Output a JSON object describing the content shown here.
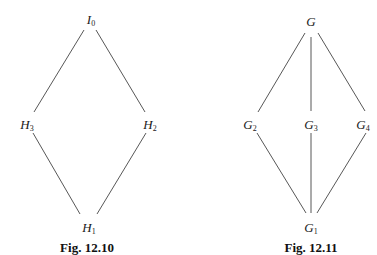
{
  "figures": [
    {
      "caption": "Fig. 12.10",
      "caption_pos": [
        87,
        247
      ],
      "nodes": [
        {
          "id": "I0",
          "base": "I",
          "sub": "0",
          "pos": [
            91,
            20
          ]
        },
        {
          "id": "H3",
          "base": "H",
          "sub": "3",
          "pos": [
            27,
            125
          ]
        },
        {
          "id": "H2",
          "base": "H",
          "sub": "2",
          "pos": [
            150,
            125
          ]
        },
        {
          "id": "H1",
          "base": "H",
          "sub": "1",
          "pos": [
            89,
            228
          ]
        }
      ],
      "edges": [
        {
          "from": "I0",
          "to": "H3",
          "line": [
            84,
            30,
            34,
            112
          ]
        },
        {
          "from": "I0",
          "to": "H2",
          "line": [
            96,
            30,
            145,
            112
          ]
        },
        {
          "from": "H3",
          "to": "H1",
          "line": [
            33,
            133,
            80,
            214
          ]
        },
        {
          "from": "H2",
          "to": "H1",
          "line": [
            146,
            133,
            97,
            214
          ]
        }
      ]
    },
    {
      "caption": "Fig. 12.11",
      "caption_pos": [
        311,
        247
      ],
      "nodes": [
        {
          "id": "G",
          "base": "G",
          "sub": "",
          "pos": [
            311,
            22
          ]
        },
        {
          "id": "G2",
          "base": "G",
          "sub": "2",
          "pos": [
            250,
            125
          ]
        },
        {
          "id": "G3",
          "base": "G",
          "sub": "3",
          "pos": [
            311,
            125
          ]
        },
        {
          "id": "G4",
          "base": "G",
          "sub": "4",
          "pos": [
            363,
            125
          ]
        },
        {
          "id": "G1",
          "base": "G",
          "sub": "1",
          "pos": [
            311,
            228
          ]
        }
      ],
      "edges": [
        {
          "from": "G",
          "to": "G2",
          "line": [
            305,
            33,
            258,
            112
          ]
        },
        {
          "from": "G",
          "to": "G3",
          "line": [
            311,
            37,
            311,
            111
          ]
        },
        {
          "from": "G",
          "to": "G4",
          "line": [
            318,
            33,
            365,
            111
          ]
        },
        {
          "from": "G2",
          "to": "G1",
          "line": [
            257,
            133,
            306,
            213
          ]
        },
        {
          "from": "G3",
          "to": "G1",
          "line": [
            311,
            133,
            311,
            213
          ]
        },
        {
          "from": "G4",
          "to": "G1",
          "line": [
            366,
            133,
            317,
            213
          ]
        }
      ]
    }
  ],
  "style": {
    "line_color": "#444444",
    "text_color": "#1a1a1a"
  }
}
